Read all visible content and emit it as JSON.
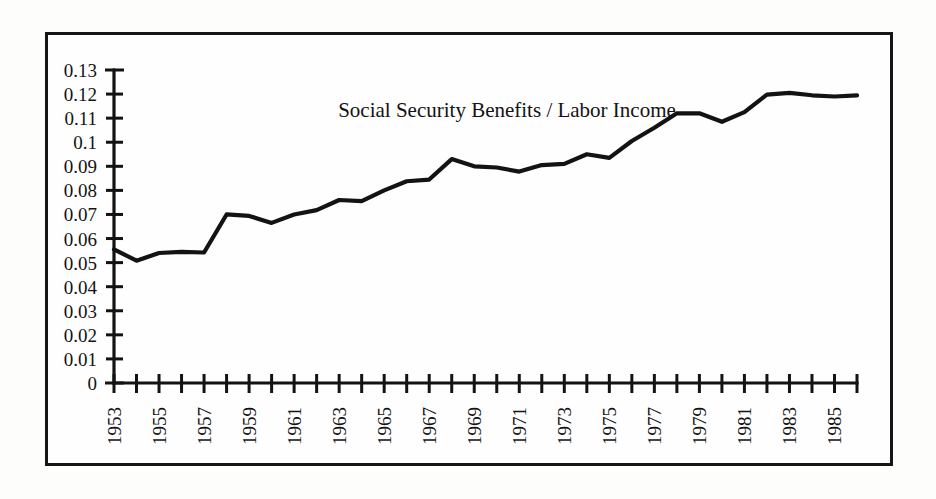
{
  "chart_data": {
    "type": "line",
    "title": "Social Security Benefits / Labor Income",
    "xlabel": "",
    "ylabel": "",
    "xlim": [
      1953,
      1986
    ],
    "ylim": [
      0,
      0.13
    ],
    "grid": false,
    "legend": null,
    "y_ticks": [
      "0.13",
      "0.12",
      "0.11",
      "0.1",
      "0.09",
      "0.08",
      "0.07",
      "0.06",
      "0.05",
      "0.04",
      "0.03",
      "0.02",
      "0.01",
      "0"
    ],
    "y_tick_values": [
      0.13,
      0.12,
      0.11,
      0.1,
      0.09,
      0.08,
      0.07,
      0.06,
      0.05,
      0.04,
      0.03,
      0.02,
      0.01,
      0
    ],
    "x_tick_values": [
      1953,
      1954,
      1955,
      1956,
      1957,
      1958,
      1959,
      1960,
      1961,
      1962,
      1963,
      1964,
      1965,
      1966,
      1967,
      1968,
      1969,
      1970,
      1971,
      1972,
      1973,
      1974,
      1975,
      1976,
      1977,
      1978,
      1979,
      1980,
      1981,
      1982,
      1983,
      1984,
      1985,
      1986
    ],
    "x_tick_labels": [
      "1953",
      "1955",
      "1957",
      "1959",
      "1961",
      "1963",
      "1965",
      "1967",
      "1969",
      "1971",
      "1973",
      "1975",
      "1977",
      "1979",
      "1981",
      "1983",
      "1985"
    ],
    "x_tick_label_values": [
      1953,
      1955,
      1957,
      1959,
      1961,
      1963,
      1965,
      1967,
      1969,
      1971,
      1973,
      1975,
      1977,
      1979,
      1981,
      1983,
      1985
    ],
    "series": [
      {
        "name": "Social Security Benefits / Labor Income",
        "x": [
          1953,
          1954,
          1955,
          1956,
          1957,
          1958,
          1959,
          1960,
          1961,
          1962,
          1963,
          1964,
          1965,
          1966,
          1967,
          1968,
          1969,
          1970,
          1971,
          1972,
          1973,
          1974,
          1975,
          1976,
          1977,
          1978,
          1979,
          1980,
          1981,
          1982,
          1983,
          1984,
          1985,
          1986
        ],
        "values": [
          0.0555,
          0.0508,
          0.054,
          0.0545,
          0.0542,
          0.07,
          0.0694,
          0.0665,
          0.07,
          0.0718,
          0.076,
          0.0755,
          0.08,
          0.0838,
          0.0845,
          0.093,
          0.09,
          0.0895,
          0.0878,
          0.0905,
          0.091,
          0.095,
          0.0935,
          0.1005,
          0.106,
          0.112,
          0.112,
          0.1085,
          0.1125,
          0.1198,
          0.1205,
          0.1195,
          0.119,
          0.1195
        ]
      }
    ],
    "line_color": "#131313",
    "background_color": "#fefefe",
    "border_color": "#161616"
  },
  "figure": {
    "title_label": "Social Security Benefits / Labor Income"
  }
}
